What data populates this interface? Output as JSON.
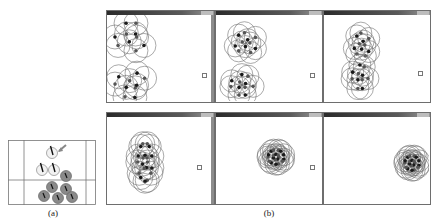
{
  "figure": {
    "caption_a": "(a)",
    "caption_b": "(b)"
  },
  "colors": {
    "frame": "#6e6e6e",
    "circle_stroke": "#707070",
    "agent_dark": "#1a1a1a",
    "agent_gray": "#8a8a8a",
    "agent_light": "#f2f2f2",
    "grid_line": "#777777"
  },
  "panel_a": {
    "description": "schematic: grid of cells with white (leader/heading) agents with direction markers and gray agents below",
    "arrow_label": "",
    "white_agents": [
      [
        44,
        13
      ],
      [
        34,
        30
      ],
      [
        46,
        30
      ]
    ],
    "gray_agents": [
      [
        58,
        36
      ],
      [
        44,
        47
      ],
      [
        58,
        49
      ],
      [
        36,
        56
      ],
      [
        50,
        58
      ],
      [
        64,
        57
      ]
    ]
  },
  "panel_b": {
    "windows": [
      {
        "row": 0,
        "col": 0,
        "target": [
          95,
          58
        ],
        "clusters": [
          {
            "cx": 24,
            "cy": 22,
            "rx": 20,
            "ry": 18,
            "n": 10,
            "r": 12
          },
          {
            "cx": 24,
            "cy": 70,
            "rx": 20,
            "ry": 16,
            "n": 10,
            "r": 12
          }
        ]
      },
      {
        "row": 0,
        "col": 1,
        "target": [
          94,
          58
        ],
        "clusters": [
          {
            "cx": 30,
            "cy": 28,
            "rx": 14,
            "ry": 13,
            "n": 11,
            "r": 11
          },
          {
            "cx": 26,
            "cy": 70,
            "rx": 14,
            "ry": 13,
            "n": 11,
            "r": 11
          }
        ]
      },
      {
        "row": 0,
        "col": 2,
        "target": [
          94,
          56
        ],
        "clusters": [
          {
            "cx": 38,
            "cy": 30,
            "rx": 10,
            "ry": 15,
            "n": 11,
            "r": 11
          },
          {
            "cx": 36,
            "cy": 62,
            "rx": 10,
            "ry": 15,
            "n": 11,
            "r": 11
          }
        ]
      },
      {
        "row": 1,
        "col": 0,
        "target": [
          90,
          48
        ],
        "clusters": [
          {
            "cx": 38,
            "cy": 45,
            "rx": 9,
            "ry": 24,
            "n": 20,
            "r": 12
          }
        ]
      },
      {
        "row": 1,
        "col": 1,
        "target": [
          94,
          48
        ],
        "clusters": [
          {
            "cx": 60,
            "cy": 40,
            "rx": 10,
            "ry": 9,
            "n": 20,
            "r": 11
          }
        ]
      },
      {
        "row": 1,
        "col": 2,
        "target": [],
        "clusters": [
          {
            "cx": 88,
            "cy": 46,
            "rx": 9,
            "ry": 9,
            "n": 20,
            "r": 11
          }
        ]
      }
    ]
  }
}
